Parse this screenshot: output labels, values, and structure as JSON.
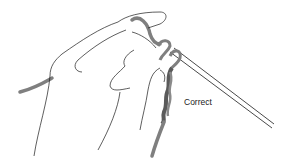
{
  "illustration": {
    "subject": "hand holding crochet hook with yarn",
    "label": "Correct",
    "colors": {
      "line": "#1a1a1a",
      "yarn": "#7f7f7f",
      "yarn_dark": "#5a5a5a",
      "background": "#ffffff"
    }
  }
}
